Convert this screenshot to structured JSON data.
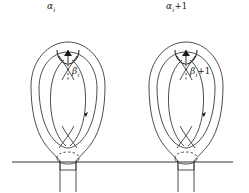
{
  "figure": {
    "type": "topology-diagram",
    "background_color": "#ffffff",
    "stroke_color": "#3a3a3a",
    "surface_line_color": "#777777"
  },
  "labels": {
    "alpha_i": {
      "symbol": "α",
      "subscript": "i",
      "suffix": ""
    },
    "alpha_i_plus_1": {
      "symbol": "α",
      "subscript": "i",
      "suffix": "+1"
    },
    "beta_i": {
      "symbol": "β",
      "subscript": "i",
      "suffix": ""
    },
    "beta_i_plus_1": {
      "symbol": "β",
      "subscript": "i",
      "suffix": "+1"
    }
  },
  "handles": [
    {
      "name": "handle-left",
      "index_label": "i",
      "alpha_label": "αi",
      "beta_label": "βi",
      "center_x": 68
    },
    {
      "name": "handle-right",
      "index_label": "i+1",
      "alpha_label": "αi+1",
      "beta_label": "βi+1",
      "center_x": 186
    }
  ],
  "surface_line": {
    "name": "base-surface-line",
    "x_start": 12,
    "x_end": 233,
    "y": 162
  }
}
